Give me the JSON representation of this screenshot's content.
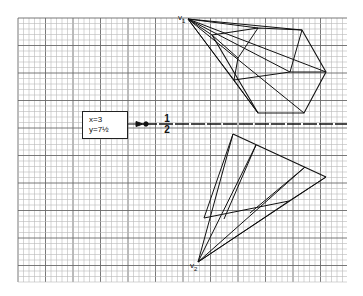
{
  "figure": {
    "grid": {
      "x0": 18,
      "y0": 18,
      "x1": 347,
      "y1": 282,
      "minor_step": 5.5,
      "major_every": 5,
      "minor_color": "#b8b8b8",
      "major_color": "#6a6a6a"
    },
    "apex_top": {
      "label": "v",
      "subscript": "1",
      "x": 188,
      "y": 19
    },
    "apex_bottom": {
      "label": "v",
      "subscript": "2",
      "x": 198,
      "y": 262
    },
    "coord_box": {
      "line1": "x=3",
      "line2": "y=7½"
    },
    "fraction": {
      "numerator": "1",
      "denominator": "2"
    },
    "axis_line": {
      "y": 124,
      "x_start": 128,
      "x_end": 347
    }
  },
  "colors": {
    "ink": "#1a1a1a",
    "background": "#ffffff"
  }
}
